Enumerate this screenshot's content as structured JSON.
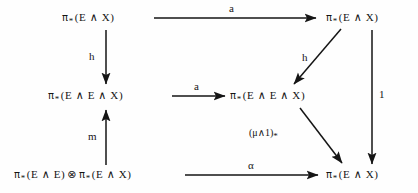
{
  "diagram": {
    "type": "commutative-diagram",
    "nodes": [
      {
        "id": "top-left",
        "text": "π*(E ∧ X)",
        "pi": "π",
        "star": "*",
        "body": "(E ∧ X)",
        "row": 1,
        "col": 1
      },
      {
        "id": "top-right",
        "text": "π*(E ∧ X)",
        "pi": "π",
        "star": "*",
        "body": "(E ∧ X)",
        "row": 1,
        "col": 3
      },
      {
        "id": "mid-left",
        "text": "π*(E ∧ E ∧ X)",
        "pi": "π",
        "star": "*",
        "body": "(E ∧ E ∧ X)",
        "row": 2,
        "col": 1
      },
      {
        "id": "mid-right",
        "text": "π*(E ∧ E ∧ X)",
        "pi": "π",
        "star": "*",
        "body": "(E ∧ E ∧ X)",
        "row": 2,
        "col": 2
      },
      {
        "id": "bottom-left",
        "text": "π*(E ∧ E) ⊗ π*(E ∧ X)",
        "pi": "π",
        "star": "*",
        "body": "(E ∧ E)",
        "pi2": "π",
        "star2": "*",
        "body2": "(E ∧ X)",
        "tensor": "⊗",
        "row": 3,
        "col": 1
      },
      {
        "id": "bottom-right",
        "text": "π*(E ∧ X)",
        "pi": "π",
        "star": "*",
        "body": "(E ∧ X)",
        "row": 3,
        "col": 3
      }
    ],
    "edges": [
      {
        "id": "top-horizontal",
        "from": "top-left",
        "to": "top-right",
        "label": "a",
        "direction": "right"
      },
      {
        "id": "left-vertical-h",
        "from": "top-left",
        "to": "mid-left",
        "label": "h",
        "direction": "down"
      },
      {
        "id": "mid-horizontal",
        "from": "mid-left",
        "to": "mid-right",
        "label": "a",
        "direction": "right"
      },
      {
        "id": "left-vertical-m",
        "from": "bottom-left",
        "to": "mid-left",
        "label": "m",
        "direction": "up"
      },
      {
        "id": "diagonal-h",
        "from": "top-right",
        "to": "mid-right",
        "label": "h",
        "direction": "down-left"
      },
      {
        "id": "right-vertical-1",
        "from": "top-right",
        "to": "bottom-right",
        "label": "1",
        "direction": "down"
      },
      {
        "id": "diagonal-mu",
        "from": "mid-right",
        "to": "bottom-right",
        "label": "(μ∧1)",
        "label_sub": "*",
        "direction": "down-right"
      },
      {
        "id": "bottom-horizontal",
        "from": "bottom-left",
        "to": "bottom-right",
        "label": "α",
        "direction": "right"
      }
    ],
    "symbols": {
      "pi": "π",
      "star": "*",
      "wedge": "∧",
      "tensor": "⊗",
      "mu": "μ",
      "alpha": "α",
      "E": "E",
      "X": "X",
      "one": "1"
    },
    "colors": {
      "ink": "#151515",
      "background": "#fefefe"
    }
  }
}
